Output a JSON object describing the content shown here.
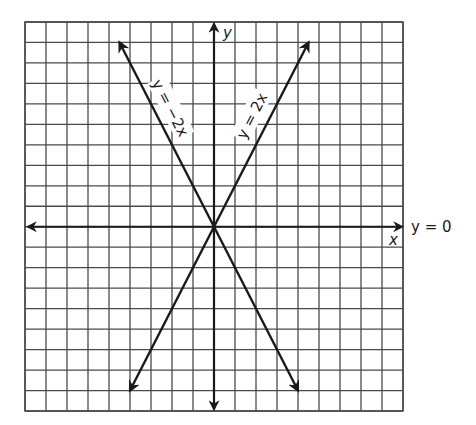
{
  "chart_data": {
    "type": "line",
    "title": "",
    "xlabel": "x",
    "ylabel": "y",
    "xlim": [
      -9,
      9
    ],
    "ylim": [
      -9,
      10
    ],
    "grid": true,
    "grid_step": 1,
    "series": [
      {
        "name": "y = -2x",
        "slope": -2,
        "intercept": 0,
        "x": [
          -4.5,
          4
        ],
        "y": [
          9,
          -8
        ]
      },
      {
        "name": "y = 2x",
        "slope": 2,
        "intercept": 0,
        "x": [
          -4,
          4.5
        ],
        "y": [
          -8,
          9
        ]
      },
      {
        "name": "y = 0",
        "slope": 0,
        "intercept": 0,
        "x": [
          -9,
          9
        ],
        "y": [
          0,
          0
        ]
      }
    ],
    "annotations": [
      {
        "text": "y = −2x",
        "along": "y = -2x"
      },
      {
        "text": "y = 2x",
        "along": "y = 2x"
      },
      {
        "text": "y = 0",
        "position": "right of x-axis"
      }
    ]
  },
  "labels": {
    "x_axis": "x",
    "y_axis": "y",
    "line_neg": "y = −2x",
    "line_pos": "y = 2x",
    "line_zero": "y = 0"
  },
  "colors": {
    "grid": "#4a4a4a",
    "line": "#1a1a1a",
    "background": "#ffffff"
  }
}
